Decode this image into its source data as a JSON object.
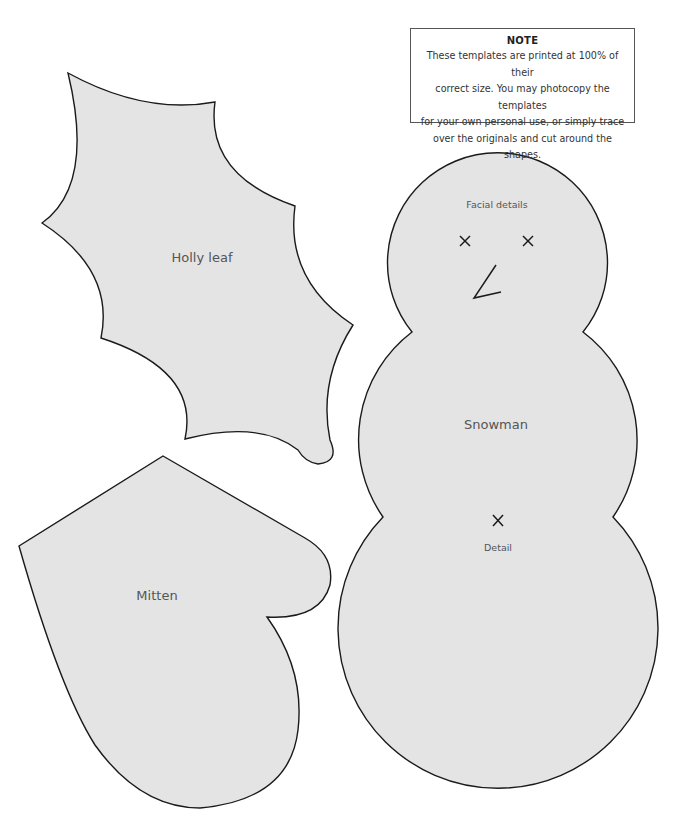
{
  "note": {
    "title": "NOTE",
    "lines": [
      "These templates are printed at 100% of their",
      "correct size. You may photocopy the templates",
      "for your own personal use, or simply trace",
      "over the originals and cut around the shapes."
    ]
  },
  "templates": {
    "holly_leaf": {
      "label": "Holly leaf"
    },
    "mitten": {
      "label": "Mitten"
    },
    "snowman": {
      "label": "Snowman",
      "facial_label": "Facial details",
      "detail_label": "Detail"
    }
  },
  "colors": {
    "fill": "#e4e4e4",
    "stroke": "#1a1a1a",
    "label": "#555555"
  }
}
